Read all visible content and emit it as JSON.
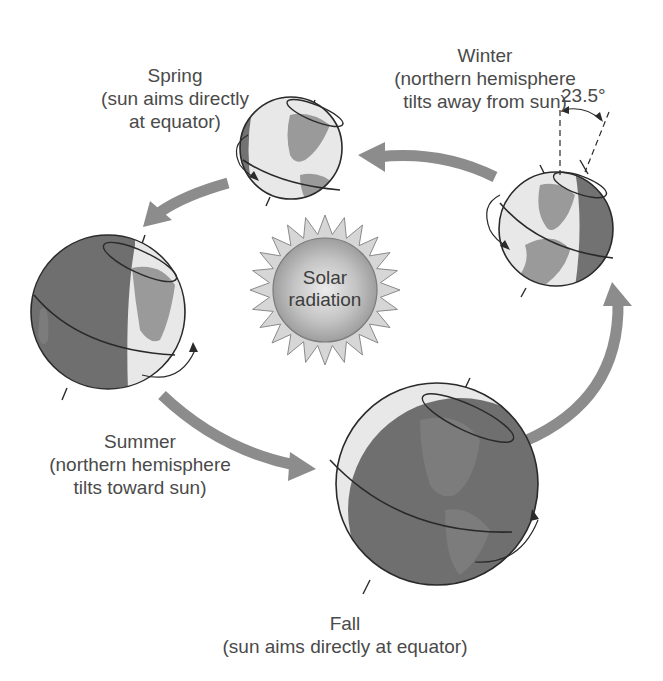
{
  "diagram": {
    "colors": {
      "arrow": "#8c8c8c",
      "globe_dark": "#6f6f6f",
      "globe_light": "#e8e8e8",
      "land_on_light": "#9a9a9a",
      "land_on_dark": "#7c7c7c",
      "outline": "#2a2a2a",
      "text": "#4a4a4a",
      "sun_rays": "#d0d0d0",
      "sun_core": "#a8a8a8"
    },
    "sun": {
      "line1": "Solar",
      "line2": "radiation"
    },
    "seasons": {
      "winter": {
        "title": "Winter",
        "line2": "(northern hemisphere",
        "line3": "tilts away from sun)"
      },
      "spring": {
        "title": "Spring",
        "line2": "(sun aims directly",
        "line3": "at equator)"
      },
      "summer": {
        "title": "Summer",
        "line2": "(northern hemisphere",
        "line3": "tilts toward sun)"
      },
      "fall": {
        "title": "Fall",
        "line2": "(sun aims directly at equator)"
      }
    },
    "tilt_angle": "23.5°"
  }
}
